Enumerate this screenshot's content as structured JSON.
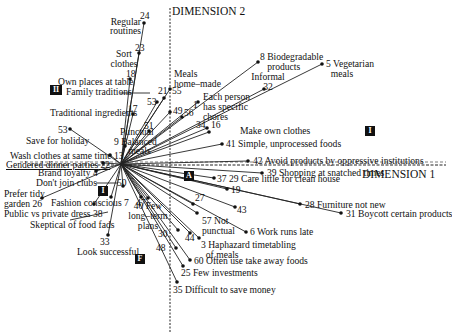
{
  "axes": {
    "dim1_label": "DIMENSION 1",
    "dim2_label": "DIMENSION 2"
  },
  "quadrants": {
    "I": "I",
    "II": "II",
    "III": "I",
    "F": "F",
    "A": "A"
  },
  "origin": {
    "x": 121,
    "y": 164
  },
  "points": [
    {
      "id": "24",
      "text": "24",
      "x": 144,
      "y": 23
    },
    {
      "id": "23",
      "text": "23",
      "x": 139,
      "y": 53
    },
    {
      "id": "18",
      "text": "18",
      "x": 130,
      "y": 79
    },
    {
      "id": "17",
      "text": "17",
      "x": 133,
      "y": 114
    },
    {
      "id": "53L",
      "text": "53",
      "x": 70,
      "y": 129
    },
    {
      "id": "13",
      "text": "13",
      "x": 110,
      "y": 155
    },
    {
      "id": "22",
      "text": "22",
      "x": 103,
      "y": 163
    },
    {
      "id": "4",
      "text": "4",
      "x": 96,
      "y": 171
    },
    {
      "id": "26",
      "text": "26",
      "x": 42,
      "y": 198
    },
    {
      "id": "38",
      "text": "38",
      "x": 94,
      "y": 204
    },
    {
      "id": "33",
      "text": "33",
      "x": 108,
      "y": 235
    },
    {
      "id": "21",
      "text": "21",
      "x": 164,
      "y": 98
    },
    {
      "id": "55",
      "text": "55",
      "x": 170,
      "y": 89
    },
    {
      "id": "53C",
      "text": "53",
      "x": 157,
      "y": 102
    },
    {
      "id": "49",
      "text": "49",
      "x": 170,
      "y": 112
    },
    {
      "id": "56",
      "text": "56",
      "x": 182,
      "y": 117
    },
    {
      "id": "1",
      "text": "1",
      "x": 198,
      "y": 102
    },
    {
      "id": "51",
      "text": "51",
      "x": 149,
      "y": 131
    },
    {
      "id": "34",
      "text": "34",
      "x": 207,
      "y": 128
    },
    {
      "id": "16",
      "text": "16",
      "x": 209,
      "y": 132
    },
    {
      "id": "41",
      "text": "41",
      "x": 222,
      "y": 144
    },
    {
      "id": "8",
      "text": "8",
      "x": 258,
      "y": 62
    },
    {
      "id": "32",
      "text": "32",
      "x": 264,
      "y": 89
    },
    {
      "id": "5",
      "text": "5",
      "x": 322,
      "y": 64
    },
    {
      "id": "42",
      "text": "42",
      "x": 248,
      "y": 161
    },
    {
      "id": "39",
      "text": "39",
      "x": 262,
      "y": 173
    },
    {
      "id": "37",
      "text": "37",
      "x": 214,
      "y": 178
    },
    {
      "id": "19",
      "text": "19",
      "x": 227,
      "y": 189
    },
    {
      "id": "43",
      "text": "43",
      "x": 235,
      "y": 207
    },
    {
      "id": "28",
      "text": "28",
      "x": 300,
      "y": 204
    },
    {
      "id": "31",
      "text": "31",
      "x": 341,
      "y": 213
    },
    {
      "id": "6",
      "text": "6",
      "x": 246,
      "y": 232
    },
    {
      "id": "57",
      "text": "57",
      "x": 197,
      "y": 213
    },
    {
      "id": "27",
      "text": "27",
      "x": 193,
      "y": 204
    },
    {
      "id": "44",
      "text": "44",
      "x": 190,
      "y": 233
    },
    {
      "id": "3",
      "text": "3",
      "x": 199,
      "y": 238
    },
    {
      "id": "30",
      "text": "30",
      "x": 178,
      "y": 230
    },
    {
      "id": "48",
      "text": "48",
      "x": 176,
      "y": 248
    },
    {
      "id": "60",
      "text": "60",
      "x": 190,
      "y": 260
    },
    {
      "id": "25",
      "text": "25",
      "x": 183,
      "y": 266
    },
    {
      "id": "35",
      "text": "35",
      "x": 177,
      "y": 282
    },
    {
      "id": "40",
      "text": "40",
      "x": 148,
      "y": 198
    },
    {
      "id": "47",
      "text": "47",
      "x": 141,
      "y": 197
    },
    {
      "id": "7",
      "text": "7",
      "x": 111,
      "y": 197
    },
    {
      "id": "50",
      "text": "50",
      "x": 123,
      "y": 186
    },
    {
      "id": "9",
      "text": "9",
      "x": 125,
      "y": 146
    }
  ],
  "labels": {
    "regular_routines": "Regular\nroutines",
    "sort_clothes": "Sort\nclothes",
    "own_places": "Own places at table",
    "family_traditions": "Family traditions",
    "traditional_ingredients": "Traditional ingredients",
    "save_holiday": "Save for holiday",
    "wash_clothes": "Wash clothes at same time",
    "gendered_dinner": "Gendered dinner parties",
    "brand_loyalty": "Brand loyalty",
    "dont_join_clubs": "Don't join clubs",
    "prefer_tidy_garden": "Prefer tidy\ngarden",
    "fashion_conscious": "Fashion conscious",
    "public_private_dress": "Public vs private dress",
    "skeptical_food_fads": "Skeptical of food fads",
    "look_successful": "Look successful",
    "meals_home_made": "Meals\nhome-made",
    "punctual": "Punctual",
    "balanced_meals": "Balanced\nmeals",
    "each_person_chores": "Each person\nhas specific\nchores",
    "make_own_clothes": "Make own clothes",
    "simple_foods": "Simple, unprocessed foods",
    "biodegradable": "Biodegradable\nproducts",
    "informal": "Informal",
    "vegetarian": "Vegetarian\nmeals",
    "avoid_products": "Avoid products by oppressive institutions",
    "shopping_snatched": "Shopping at snatched times",
    "care_little_clean": "Care little for clean house",
    "furniture_not_new": "Furniture not new",
    "boycott": "Boycott certain products",
    "work_runs_late": "Work runs late",
    "not_punctual": "Not\npunctual",
    "haphazard": "Haphazard timetabling\nof meals",
    "take_away": "Often use take away foods",
    "few_investments": "Few investments",
    "difficult_save": "Difficult to save money",
    "few_long_term": "Few\nlong-term\nplans"
  }
}
